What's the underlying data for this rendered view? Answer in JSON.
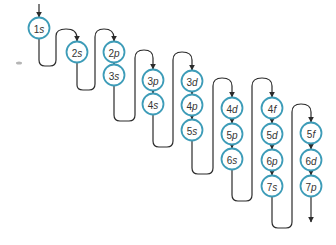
{
  "colors": {
    "circle_stroke": "#3d9cb8",
    "line": "#2b2b2b",
    "text": "#333333"
  },
  "orbitals": [
    {
      "n": "1",
      "l": "s",
      "x": 39,
      "y": 28
    },
    {
      "n": "2",
      "l": "s",
      "x": 77,
      "y": 52
    },
    {
      "n": "2",
      "l": "p",
      "x": 114,
      "y": 52
    },
    {
      "n": "3",
      "l": "s",
      "x": 114,
      "y": 75
    },
    {
      "n": "3",
      "l": "p",
      "x": 153,
      "y": 80
    },
    {
      "n": "4",
      "l": "s",
      "x": 153,
      "y": 104
    },
    {
      "n": "3",
      "l": "d",
      "x": 192,
      "y": 81
    },
    {
      "n": "4",
      "l": "p",
      "x": 192,
      "y": 105
    },
    {
      "n": "5",
      "l": "s",
      "x": 192,
      "y": 130
    },
    {
      "n": "4",
      "l": "d",
      "x": 232,
      "y": 108
    },
    {
      "n": "5",
      "l": "p",
      "x": 232,
      "y": 134
    },
    {
      "n": "6",
      "l": "s",
      "x": 232,
      "y": 159
    },
    {
      "n": "4",
      "l": "f",
      "x": 272,
      "y": 108
    },
    {
      "n": "5",
      "l": "d",
      "x": 272,
      "y": 134
    },
    {
      "n": "6",
      "l": "p",
      "x": 272,
      "y": 160
    },
    {
      "n": "7",
      "l": "s",
      "x": 272,
      "y": 186
    },
    {
      "n": "5",
      "l": "f",
      "x": 311,
      "y": 133
    },
    {
      "n": "6",
      "l": "d",
      "x": 311,
      "y": 160
    },
    {
      "n": "7",
      "l": "p",
      "x": 311,
      "y": 186
    }
  ]
}
